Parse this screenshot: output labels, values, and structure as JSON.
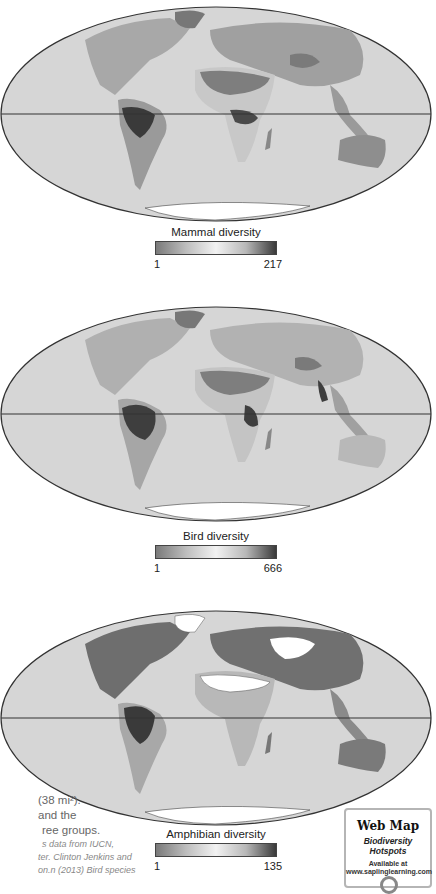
{
  "maps": [
    {
      "id": "mammal",
      "legend_title": "Mammal diversity",
      "legend_min": "1",
      "legend_max": "217"
    },
    {
      "id": "bird",
      "legend_title": "Bird diversity",
      "legend_min": "1",
      "legend_max": "666"
    },
    {
      "id": "amphibian",
      "legend_title": "Amphibian diversity",
      "legend_min": "1",
      "legend_max": "135"
    }
  ],
  "caption": {
    "line1": "(38 mi²).",
    "line2": "and the",
    "line3": "ree groups.",
    "line4": "s data from IUCN,",
    "line5": "ter. Clinton Jenkins and",
    "line6": "on.n (2013) Bird species"
  },
  "webmap": {
    "title": "Web Map",
    "subtitle": "Biodiversity Hotspots",
    "available": "Available at",
    "url": "www.saplinglearning.com"
  },
  "colors": {
    "ocean": "#d4d4d4",
    "land_low": "#8a8a8a",
    "land_mid": "#f0f0f0",
    "land_high": "#3a3a3a",
    "outline": "#333333"
  }
}
